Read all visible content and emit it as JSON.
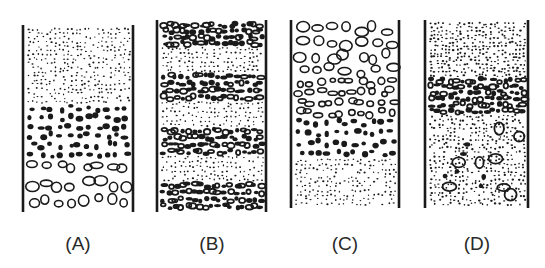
{
  "figure": {
    "ink_color": "#1a1a1a",
    "background_color": "#ffffff",
    "columns": [
      {
        "id": "A",
        "label": "(A)",
        "pattern": "normal-graded",
        "layers_top_to_bottom": [
          {
            "grain": "fine",
            "share": 0.42
          },
          {
            "grain": "medium-solid",
            "share": 0.3
          },
          {
            "grain": "coarse-open",
            "share": 0.28
          }
        ]
      },
      {
        "id": "B",
        "label": "(B)",
        "pattern": "alternating-bands",
        "layers_top_to_bottom": [
          {
            "grain": "coarse-dense",
            "share": 0.13
          },
          {
            "grain": "fine",
            "share": 0.14
          },
          {
            "grain": "coarse-dense",
            "share": 0.15
          },
          {
            "grain": "fine",
            "share": 0.14
          },
          {
            "grain": "coarse-dense",
            "share": 0.15
          },
          {
            "grain": "fine",
            "share": 0.14
          },
          {
            "grain": "coarse-dense",
            "share": 0.15
          }
        ]
      },
      {
        "id": "C",
        "label": "(C)",
        "pattern": "inverse-graded",
        "layers_top_to_bottom": [
          {
            "grain": "coarse-open",
            "share": 0.3
          },
          {
            "grain": "medium-open",
            "share": 0.22
          },
          {
            "grain": "medium-solid",
            "share": 0.22
          },
          {
            "grain": "fine",
            "share": 0.26
          }
        ]
      },
      {
        "id": "D",
        "label": "(D)",
        "pattern": "mixed-with-coarse-band",
        "layers_top_to_bottom": [
          {
            "grain": "fine-dense",
            "share": 0.3
          },
          {
            "grain": "coarse-dense",
            "share": 0.2
          },
          {
            "grain": "fine-mixed-with-scattered-coarse",
            "share": 0.5
          }
        ]
      }
    ]
  }
}
